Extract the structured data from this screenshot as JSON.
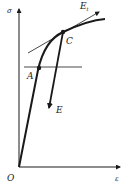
{
  "diagram": {
    "type": "stress-strain curve",
    "axes": {
      "y_label": "σ",
      "x_label": "ε",
      "origin_label": "O"
    },
    "points": [
      {
        "id": "A",
        "label": "A"
      },
      {
        "id": "C",
        "label": "C"
      }
    ],
    "lines": {
      "tangent_label": "E",
      "tangent_subscript": "t",
      "unloading_label": "E"
    },
    "colors": {
      "ink": "#1a1a1a",
      "background": "#ffffff"
    }
  }
}
